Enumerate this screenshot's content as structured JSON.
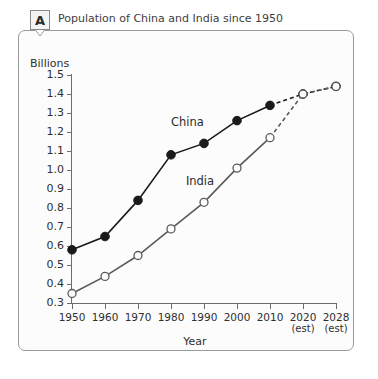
{
  "panel": {
    "tag": "A",
    "title": "Population of China and India since 1950"
  },
  "chart_data": {
    "type": "line",
    "title": "Population of China and India since 1950",
    "xlabel": "Year",
    "ylabel": "Billions",
    "ylim": [
      0.3,
      1.5
    ],
    "ytick_labels": [
      "1.5",
      "1.4",
      "1.3",
      "1.2",
      "1.1",
      "1.0",
      "0.9",
      "0.8",
      "0.7",
      "0.6",
      "0.5",
      "0.4",
      "0.3"
    ],
    "ytick_values": [
      1.5,
      1.4,
      1.3,
      1.2,
      1.1,
      1.0,
      0.9,
      0.8,
      0.7,
      0.6,
      0.5,
      0.4,
      0.3
    ],
    "categories": [
      "1950",
      "1960",
      "1970",
      "1980",
      "1990",
      "2000",
      "2010",
      "2020",
      "2028"
    ],
    "category_sublabels": [
      "",
      "",
      "",
      "",
      "",
      "",
      "",
      "(est)",
      "(est)"
    ],
    "x": [
      1950,
      1960,
      1970,
      1980,
      1990,
      2000,
      2010,
      2020,
      2028
    ],
    "grid": false,
    "legend": "inline-annotations",
    "series": [
      {
        "name": "China",
        "marker": "filled-circle",
        "color": "#1a1a1a",
        "values": [
          0.58,
          0.65,
          0.84,
          1.08,
          1.14,
          1.26,
          1.34,
          1.4,
          1.44
        ],
        "projected_from": 2010,
        "label_x": 1990,
        "label_y": 1.245
      },
      {
        "name": "India",
        "marker": "open-circle",
        "color": "#5a5a5a",
        "values": [
          0.35,
          0.44,
          0.55,
          0.69,
          0.83,
          1.01,
          1.17,
          1.4,
          1.44
        ],
        "projected_from": 2010,
        "label_x": 1993,
        "label_y": 0.935
      }
    ],
    "annotations": [
      {
        "text": "China"
      },
      {
        "text": "India"
      }
    ]
  },
  "colors": {
    "frame": "#9a9a9a",
    "axis": "#6d6d6d",
    "china_line": "#1a1a1a",
    "india_line": "#5a5a5a",
    "background": "#fcfcfc",
    "text": "#2f2f2f"
  }
}
